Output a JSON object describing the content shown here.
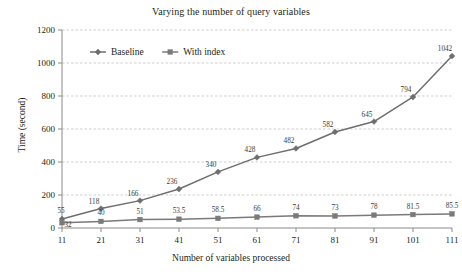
{
  "chart_data": {
    "type": "line",
    "title": "Varying the number of query variables",
    "xlabel": "Number of variables processed",
    "ylabel": "Time (second)",
    "x": [
      11,
      21,
      31,
      41,
      51,
      61,
      71,
      81,
      91,
      101,
      111
    ],
    "xtick_labels": [
      "11",
      "21",
      "31",
      "41",
      "51",
      "61",
      "71",
      "81",
      "91",
      "101",
      "111"
    ],
    "ytick_labels": [
      "0",
      "200",
      "400",
      "600",
      "800",
      "1000",
      "1200"
    ],
    "yticks": [
      0,
      200,
      400,
      600,
      800,
      1000,
      1200
    ],
    "ylim": [
      0,
      1200
    ],
    "grid": "horizontal-dashed",
    "legend_position": "top-left-inside",
    "series": [
      {
        "name": "Baseline",
        "color": "#6e6e6e",
        "marker": "diamond",
        "values": [
          55,
          118,
          166,
          236,
          340,
          428,
          482,
          582,
          645,
          794,
          1042
        ],
        "labels": [
          "55",
          "118",
          "166",
          "236",
          "340",
          "428",
          "482",
          "582",
          "645",
          "794",
          "1042"
        ]
      },
      {
        "name": "With index",
        "color": "#7a7a7a",
        "marker": "square",
        "values": [
          32,
          40,
          51,
          53.5,
          58.5,
          66,
          74,
          73,
          78,
          81.5,
          85.5
        ],
        "labels": [
          "32",
          "40",
          "51",
          "53.5",
          "58.5",
          "66",
          "74",
          "73",
          "78",
          "81.5",
          "85.5"
        ]
      }
    ]
  },
  "legend": {
    "items": [
      {
        "label": "Baseline"
      },
      {
        "label": "With index"
      }
    ]
  },
  "colors": {
    "axis": "#8a8a8a",
    "grid": "#b9b9b9",
    "line": "#6e6e6e",
    "text": "#231f20"
  }
}
